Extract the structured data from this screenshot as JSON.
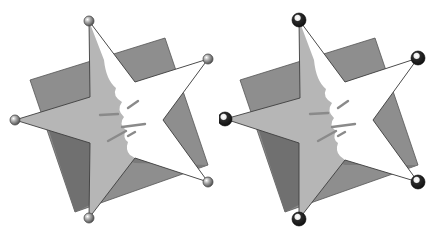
{
  "figure": {
    "panels": [
      {
        "id": "left",
        "handle_style": "small-gray-sphere"
      },
      {
        "id": "right",
        "handle_style": "large-dark-sphere"
      }
    ]
  },
  "colors": {
    "background": "#ffffff",
    "back_square": "#8e8e8e",
    "back_square_shadow": "#6e6e6e",
    "star_shaded": "#b4b4b4",
    "star_highlight": "#ffffff",
    "outline": "#444444",
    "handle_small": "#9a9a9a",
    "handle_large": "#1e1e1e"
  }
}
